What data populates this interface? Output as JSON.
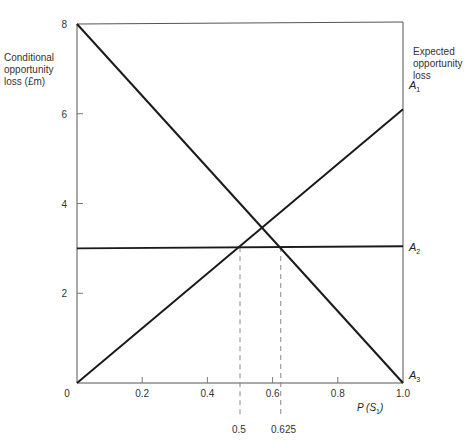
{
  "chart_data": {
    "type": "line",
    "title": "",
    "xlabel": "P (S1)",
    "ylabel_left": "Conditional opportunity loss (£m)",
    "ylabel_right": "Expected opportunity loss",
    "xlim": [
      0,
      1.0
    ],
    "ylim": [
      0,
      8
    ],
    "x_ticks": [
      "0",
      "0.2",
      "0.4",
      "0.6",
      "0.8",
      "1.0"
    ],
    "y_ticks": [
      "2",
      "4",
      "6",
      "8"
    ],
    "grid": false,
    "legend": "inline labels at right edge",
    "series": [
      {
        "name": "A1",
        "x": [
          0,
          1.0
        ],
        "values": [
          0,
          6.1
        ]
      },
      {
        "name": "A2",
        "x": [
          0,
          1.0
        ],
        "values": [
          3.0,
          3.05
        ]
      },
      {
        "name": "A3",
        "x": [
          0,
          1.0
        ],
        "values": [
          8,
          0
        ]
      }
    ],
    "annotations": [
      {
        "type": "dashed-vertical",
        "x": 0.5,
        "label": "0.5"
      },
      {
        "type": "dashed-vertical",
        "x": 0.625,
        "label": "0.625"
      }
    ]
  },
  "labels": {
    "ylabel_left_lines": [
      "Conditional",
      "opportunity",
      "loss (£m)"
    ],
    "ylabel_right_lines": [
      "Expected",
      "opportunity",
      "loss"
    ],
    "xlabel_main": "P (S",
    "xlabel_sub": "1",
    "xlabel_close": ")",
    "origin": "0",
    "a1": "A",
    "a1_sub": "1",
    "a2": "A",
    "a2_sub": "2",
    "a3": "A",
    "a3_sub": "3",
    "dash1": "0.5",
    "dash2": "0.625"
  }
}
